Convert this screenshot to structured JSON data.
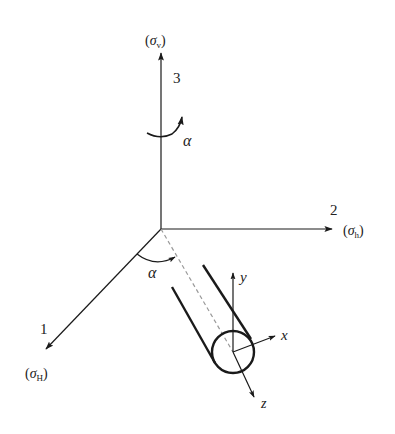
{
  "diagram": {
    "type": "coordinate-system-stress-orientation",
    "colors": {
      "stroke": "#1a1a1a",
      "dashed": "#9a9a9a",
      "background": "#ffffff"
    },
    "axes": [
      {
        "id": "axis-3",
        "number_label": "3",
        "stress_label_symbol": "σ",
        "stress_label_sub": "v",
        "direction": "up"
      },
      {
        "id": "axis-2",
        "number_label": "2",
        "stress_label_symbol": "σ",
        "stress_label_sub": "h",
        "direction": "right"
      },
      {
        "id": "axis-1",
        "number_label": "1",
        "stress_label_symbol": "σ",
        "stress_label_sub": "H",
        "direction": "down-left"
      }
    ],
    "angles": [
      {
        "id": "alpha-rotation-about-axis-3",
        "label": "α"
      },
      {
        "id": "alpha-between-axis-1-and-borehole",
        "label": "α"
      }
    ],
    "borehole_axes": [
      {
        "id": "local-y",
        "label": "y"
      },
      {
        "id": "local-x",
        "label": "x"
      },
      {
        "id": "local-z",
        "label": "z"
      }
    ],
    "paren_open": "(",
    "paren_close": ")"
  }
}
